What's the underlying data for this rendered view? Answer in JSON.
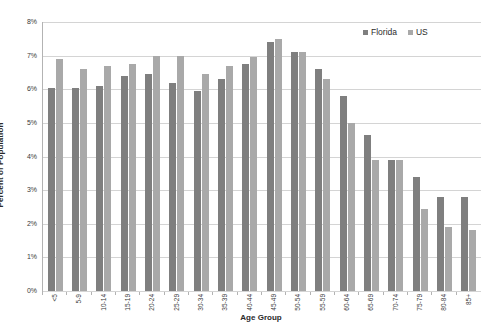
{
  "chart_data": {
    "type": "bar",
    "title": "",
    "xlabel": "Age Group",
    "ylabel": "Percent of Population",
    "ylim": [
      0,
      8
    ],
    "y_tick_labels": [
      "8%",
      "7%",
      "6%",
      "5%",
      "4%",
      "3%",
      "2%",
      "1%",
      "0%"
    ],
    "y_tick_values": [
      8,
      7,
      6,
      5,
      4,
      3,
      2,
      1,
      0
    ],
    "grid": true,
    "legend_position": "top-right",
    "categories": [
      "<5",
      "5-9",
      "10-14",
      "15-19",
      "20-24",
      "25-29",
      "30-34",
      "35-39",
      "40-44",
      "45-49",
      "50-54",
      "55-59",
      "60-64",
      "65-69",
      "70-74",
      "75-79",
      "80-84",
      "85+"
    ],
    "series": [
      {
        "name": "Florida",
        "color": "#7f7f7f",
        "values": [
          6.05,
          6.05,
          6.1,
          6.4,
          6.45,
          6.2,
          5.95,
          6.3,
          6.75,
          7.4,
          7.1,
          6.6,
          5.8,
          4.65,
          3.9,
          3.4,
          2.8,
          2.8
        ]
      },
      {
        "name": "US",
        "color": "#a9a9a9",
        "values": [
          6.9,
          6.6,
          6.7,
          6.75,
          7.0,
          7.0,
          6.45,
          6.7,
          6.95,
          7.5,
          7.1,
          6.3,
          5.0,
          3.9,
          3.9,
          2.45,
          1.9,
          1.8
        ]
      }
    ]
  },
  "legend": {
    "items": [
      {
        "label": "Florida",
        "color": "#7f7f7f"
      },
      {
        "label": "US",
        "color": "#a9a9a9"
      }
    ]
  },
  "axes": {
    "x_title": "Age Group",
    "y_title": "Percent of Population"
  }
}
